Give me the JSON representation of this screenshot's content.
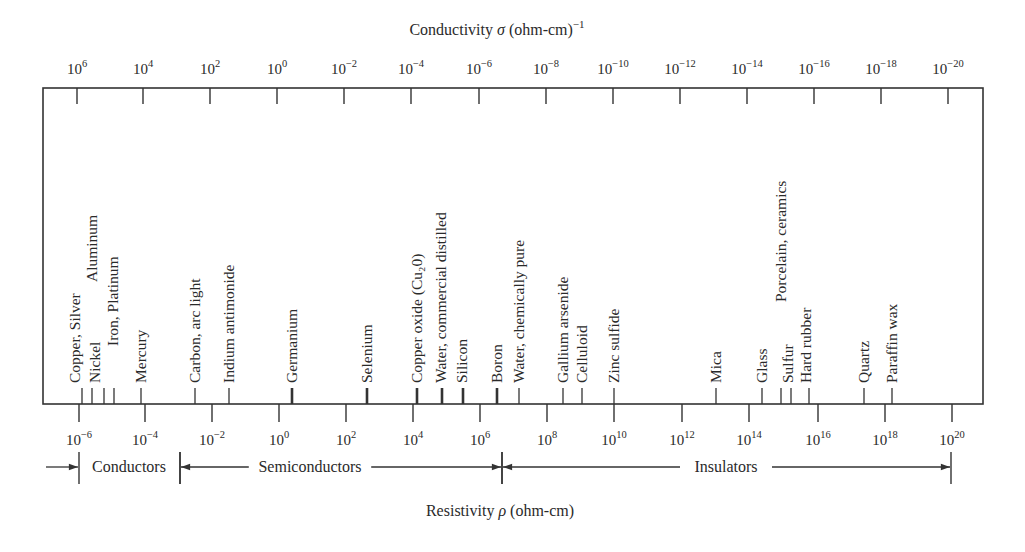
{
  "chart_data": {
    "type": "scale-diagram",
    "title_top": "Conductivity σ (ohm-cm)⁻¹",
    "title_bottom": "Resistivity ρ (ohm-cm)",
    "conductivity_axis": {
      "label_parts": {
        "main": "Conductivity ",
        "sym": "σ",
        "unit": " (ohm-cm)",
        "sup": "−1"
      },
      "ticks": [
        {
          "base": "10",
          "exp": "6",
          "x": 77
        },
        {
          "base": "10",
          "exp": "4",
          "x": 143
        },
        {
          "base": "10",
          "exp": "2",
          "x": 210
        },
        {
          "base": "10",
          "exp": "0",
          "x": 277
        },
        {
          "base": "10",
          "exp": "−2",
          "x": 344
        },
        {
          "base": "10",
          "exp": "−4",
          "x": 411
        },
        {
          "base": "10",
          "exp": "−6",
          "x": 479
        },
        {
          "base": "10",
          "exp": "−8",
          "x": 546
        },
        {
          "base": "10",
          "exp": "−10",
          "x": 613
        },
        {
          "base": "10",
          "exp": "−12",
          "x": 680
        },
        {
          "base": "10",
          "exp": "−14",
          "x": 747
        },
        {
          "base": "10",
          "exp": "−16",
          "x": 814
        },
        {
          "base": "10",
          "exp": "−18",
          "x": 881
        },
        {
          "base": "10",
          "exp": "−20",
          "x": 948
        }
      ]
    },
    "resistivity_axis": {
      "label_parts": {
        "main": "Resistivity ",
        "sym": "ρ",
        "unit": " (ohm-cm)"
      },
      "ticks": [
        {
          "base": "10",
          "exp": "−6",
          "x": 79
        },
        {
          "base": "10",
          "exp": "−4",
          "x": 145
        },
        {
          "base": "10",
          "exp": "−2",
          "x": 212
        },
        {
          "base": "10",
          "exp": "0",
          "x": 279
        },
        {
          "base": "10",
          "exp": "2",
          "x": 346
        },
        {
          "base": "10",
          "exp": "4",
          "x": 413
        },
        {
          "base": "10",
          "exp": "6",
          "x": 480
        },
        {
          "base": "10",
          "exp": "8",
          "x": 547
        },
        {
          "base": "10",
          "exp": "10",
          "x": 614
        },
        {
          "base": "10",
          "exp": "12",
          "x": 682
        },
        {
          "base": "10",
          "exp": "14",
          "x": 749
        },
        {
          "base": "10",
          "exp": "16",
          "x": 818
        },
        {
          "base": "10",
          "exp": "18",
          "x": 885
        },
        {
          "base": "10",
          "exp": "20",
          "x": 952
        }
      ]
    },
    "materials": [
      {
        "name": "Copper, Silver",
        "log_resistivity": -5.9,
        "tick_x": 82,
        "label_x": 80,
        "label_bottom": 383,
        "bold": false
      },
      {
        "name": "Nickel",
        "log_resistivity": -5.6,
        "tick_x": 92,
        "label_x": 100,
        "label_bottom": 383,
        "bold": false
      },
      {
        "name": "Aluminum",
        "log_resistivity": -5.5,
        "tick_x": 92,
        "label_x": 97,
        "label_bottom": 282,
        "bold": false,
        "tickless": true
      },
      {
        "name": "Iron, Platinum",
        "log_resistivity": -5.0,
        "tick_x": 104,
        "label_x": 118,
        "label_bottom": 346,
        "bold": false
      },
      {
        "name": "Aluminum/Platinum tick",
        "log_resistivity": -4.9,
        "tick_x": 114,
        "label_x": 0,
        "label_bottom": 0,
        "bold": false,
        "hidden_label": true
      },
      {
        "name": "Mercury",
        "log_resistivity": -4.1,
        "tick_x": 141,
        "label_x": 146,
        "label_bottom": 383,
        "bold": false
      },
      {
        "name": "Carbon, arc light",
        "log_resistivity": -2.5,
        "tick_x": 195,
        "label_x": 200,
        "label_bottom": 383,
        "bold": false
      },
      {
        "name": "Indium antimonide",
        "log_resistivity": -1.5,
        "tick_x": 229,
        "label_x": 234,
        "label_bottom": 383,
        "bold": false
      },
      {
        "name": "Germanium",
        "log_resistivity": 0.4,
        "tick_x": 292,
        "label_x": 297,
        "label_bottom": 383,
        "bold": true
      },
      {
        "name": "Selenium",
        "log_resistivity": 2.6,
        "tick_x": 367,
        "label_x": 372,
        "label_bottom": 383,
        "bold": true
      },
      {
        "name": "Copper oxide (Cu₂0)",
        "log_resistivity": 4.1,
        "tick_x": 417,
        "label_x": 422,
        "label_bottom": 383,
        "bold": true
      },
      {
        "name": "Water, commercial distilled",
        "log_resistivity": 4.9,
        "tick_x": 442,
        "label_x": 446,
        "label_bottom": 383,
        "bold": true
      },
      {
        "name": "Silicon",
        "log_resistivity": 5.5,
        "tick_x": 463,
        "label_x": 467,
        "label_bottom": 383,
        "bold": true
      },
      {
        "name": "Boron",
        "log_resistivity": 6.5,
        "tick_x": 497,
        "label_x": 502,
        "label_bottom": 383,
        "bold": true
      },
      {
        "name": "Water, chemically pure",
        "log_resistivity": 7.2,
        "tick_x": 519,
        "label_x": 524,
        "label_bottom": 383,
        "bold": false
      },
      {
        "name": "Gallium arsenide",
        "log_resistivity": 8.5,
        "tick_x": 563,
        "label_x": 568,
        "label_bottom": 383,
        "bold": false
      },
      {
        "name": "Celluloid",
        "log_resistivity": 9.0,
        "tick_x": 582,
        "label_x": 587,
        "label_bottom": 383,
        "bold": false
      },
      {
        "name": "Zinc sulfide",
        "log_resistivity": 10.0,
        "tick_x": 614,
        "label_x": 619,
        "label_bottom": 383,
        "bold": false
      },
      {
        "name": "Mica",
        "log_resistivity": 13.0,
        "tick_x": 716,
        "label_x": 721,
        "label_bottom": 383,
        "bold": false
      },
      {
        "name": "Glass",
        "log_resistivity": 14.4,
        "tick_x": 762,
        "label_x": 767,
        "label_bottom": 383,
        "bold": false
      },
      {
        "name": "Porcelain, ceramics",
        "log_resistivity": 14.9,
        "tick_x": 781,
        "label_x": 786,
        "label_bottom": 302,
        "bold": false
      },
      {
        "name": "Sulfur",
        "log_resistivity": 15.2,
        "tick_x": 791,
        "label_x": 793,
        "label_bottom": 383,
        "bold": false
      },
      {
        "name": "Hard rubber",
        "log_resistivity": 15.8,
        "tick_x": 809,
        "label_x": 811,
        "label_bottom": 383,
        "bold": false
      },
      {
        "name": "Quartz",
        "log_resistivity": 17.4,
        "tick_x": 864,
        "label_x": 869,
        "label_bottom": 383,
        "bold": false
      },
      {
        "name": "Paraffin wax",
        "log_resistivity": 18.2,
        "tick_x": 892,
        "label_x": 897,
        "label_bottom": 383,
        "bold": false
      }
    ],
    "ranges": [
      {
        "name": "Conductors",
        "from_x": 79,
        "to_x": 180,
        "label_x": 129,
        "lead_in_arrow_from_x": 46
      },
      {
        "name": "Semiconductors",
        "from_x": 180,
        "to_x": 502,
        "label_x": 310
      },
      {
        "name": "Insulators",
        "from_x": 502,
        "to_x": 951,
        "label_x": 726
      }
    ],
    "layout": {
      "box": {
        "left": 43,
        "right": 983,
        "top": 88,
        "bottom": 404
      },
      "top_tick_len": 16,
      "bottom_tick_len": 18,
      "material_tick_len": 16,
      "top_label_y": 74,
      "bottom_label_y": 445,
      "range_y": 467,
      "range_divider_top": 452,
      "range_divider_bottom": 484,
      "title_top_y": 30,
      "title_bottom_y": 512
    }
  }
}
